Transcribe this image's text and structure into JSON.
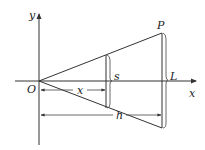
{
  "diagram": {
    "title": "",
    "colors": {
      "stroke": "#333333",
      "label": "#222222",
      "background": "#ffffff"
    },
    "axes": {
      "x_label": "x",
      "y_label": "y"
    },
    "points": {
      "origin": "O",
      "apex_top": "P"
    },
    "dimensions": {
      "cross_section_width": "s",
      "end_width": "L",
      "distance_to_cross_section": "x",
      "total_length": "h"
    }
  }
}
